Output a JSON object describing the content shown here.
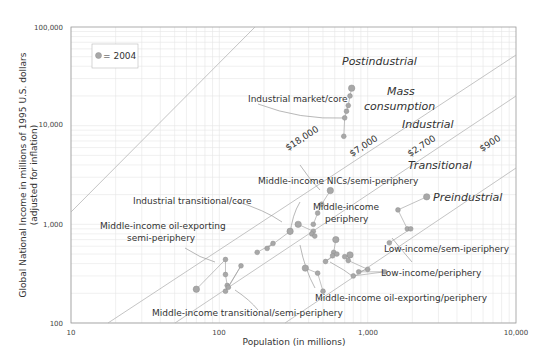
{
  "chart_data": {
    "type": "scatter",
    "title": "",
    "xlabel": "Population (in millions)",
    "ylabel": "Global National Income in millions of 1995 U.S. dollars",
    "ylabel_sub": "(adjusted for inflation)",
    "xscale": "log",
    "yscale": "log",
    "xlim": [
      10,
      10000
    ],
    "ylim": [
      100,
      100000
    ],
    "x_ticks": [
      "10",
      "100",
      "1,000",
      "10,000"
    ],
    "y_ticks": [
      "100",
      "1,000",
      "10,000",
      "100,000"
    ],
    "grid": true,
    "legend": {
      "position": "top-left",
      "entries": [
        "= 2004"
      ]
    },
    "per_capita_lines": [
      {
        "label": "$18,000",
        "value": 18000
      },
      {
        "label": "$7,000",
        "value": 7000
      },
      {
        "label": "$2,700",
        "value": 2700
      },
      {
        "label": "$900",
        "value": 900
      }
    ],
    "stage_labels": [
      "Postindustrial",
      "Mass consumption",
      "Industrial",
      "Transitional",
      "Preindustrial"
    ],
    "group_labels": [
      "Industrial market/core",
      "Middle-income NICs/semi-periphery",
      "Industrial transitional/core",
      "Middle-income oil-exporting semi-periphery",
      "Middle-income periphery",
      "Low-income/sem-iperiphery",
      "Low-income/periphery",
      "Middle-income oil-exporting/periphery",
      "Middle-income transitional/semi-periphery"
    ],
    "series": [
      {
        "name": "Industrial market/core",
        "points": [
          [
            780,
            24000
          ],
          [
            760,
            20000
          ],
          [
            740,
            16000
          ],
          [
            720,
            14000
          ],
          [
            700,
            12000
          ],
          [
            690,
            7800
          ]
        ]
      },
      {
        "name": "Middle-income NICs/semi-periphery",
        "points": [
          [
            560,
            2200
          ],
          [
            490,
            1600
          ],
          [
            460,
            1300
          ],
          [
            430,
            1000
          ]
        ]
      },
      {
        "name": "Industrial transitional/core",
        "points": [
          [
            340,
            1000
          ],
          [
            430,
            850
          ],
          [
            420,
            800
          ],
          [
            440,
            760
          ]
        ]
      },
      {
        "name": "Middle-income oil-exporting semi-periphery",
        "points": [
          [
            300,
            850
          ],
          [
            210,
            570
          ],
          [
            230,
            640
          ],
          [
            180,
            520
          ]
        ]
      },
      {
        "name": "Middle-income periphery",
        "points": [
          [
            610,
            700
          ],
          [
            590,
            520
          ],
          [
            580,
            480
          ],
          [
            520,
            420
          ],
          [
            620,
            500
          ]
        ]
      },
      {
        "name": "Low-income/sem-iperiphery",
        "points": [
          [
            2500,
            1900
          ],
          [
            1600,
            1400
          ],
          [
            1850,
            900
          ],
          [
            1950,
            900
          ],
          [
            1400,
            650
          ]
        ]
      },
      {
        "name": "Low-income/periphery",
        "points": [
          [
            760,
            490
          ],
          [
            700,
            470
          ],
          [
            740,
            430
          ],
          [
            1000,
            350
          ],
          [
            870,
            330
          ],
          [
            1300,
            330
          ],
          [
            800,
            300
          ]
        ]
      },
      {
        "name": "Middle-income oil-exporting/periphery",
        "points": [
          [
            380,
            360
          ],
          [
            460,
            320
          ],
          [
            500,
            210
          ]
        ]
      },
      {
        "name": "Middle-income transitional/semi-periphery",
        "points": [
          [
            70,
            220
          ],
          [
            110,
            440
          ],
          [
            110,
            310
          ],
          [
            113,
            240
          ],
          [
            110,
            210
          ],
          [
            140,
            380
          ],
          [
            115,
            230
          ]
        ]
      }
    ]
  },
  "legend_text": "= 2004",
  "axis": {
    "x_title": "Population (in millions)",
    "y_title_line1": "Global National Income in millions of 1995 U.S. dollars",
    "y_title_line2": "(adjusted for inflation)",
    "x_ticks": [
      "10",
      "100",
      "1,000",
      "10,000"
    ],
    "y_ticks": [
      "100",
      "1,000",
      "10,000",
      "100,000"
    ]
  },
  "prices": [
    "$18,000",
    "$7,000",
    "$2,700",
    "$900"
  ],
  "stages": {
    "postindustrial": "Postindustrial",
    "mass1": "Mass",
    "mass2": "consumption",
    "industrial": "Industrial",
    "transitional": "Transitional",
    "preindustrial": "Preindustrial"
  },
  "groups": {
    "industrial_market_core": "Industrial market/core",
    "mi_nics": "Middle-income NICs/semi-periphery",
    "industrial_transitional_core": "Industrial transitional/core",
    "mi_oil_semi_1": "Middle-income oil-exporting",
    "mi_oil_semi_2": "semi-periphery",
    "mi_periphery_1": "Middle-income",
    "mi_periphery_2": "periphery",
    "low_semi": "Low-income/sem-iperiphery",
    "low_periphery": "Low-income/periphery",
    "mi_oil_periphery": "Middle-income oil-exporting/periphery",
    "mi_transitional": "Middle-income transitional/semi-periphery"
  },
  "colors": {
    "grid": "#e6e6e6",
    "axis": "#888888",
    "diag": "#b0b0b0",
    "dot": "#a8a8a8",
    "dot_stroke": "#8e8e8e",
    "leader": "#999999"
  }
}
